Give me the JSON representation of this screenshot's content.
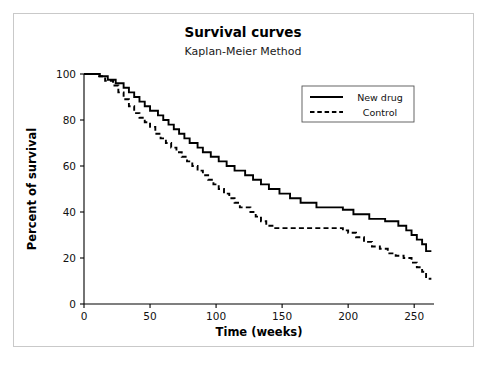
{
  "chart_data": {
    "type": "line",
    "title": "Survival curves",
    "subtitle": "Kaplan-Meier Method",
    "xlabel": "Time (weeks)",
    "ylabel": "Percent of survival",
    "xlim": [
      0,
      265
    ],
    "ylim": [
      0,
      100
    ],
    "xticks": [
      0,
      50,
      100,
      150,
      200,
      250
    ],
    "yticks": [
      0,
      20,
      40,
      60,
      80,
      100
    ],
    "grid": false,
    "legend_position": "top-right",
    "series": [
      {
        "name": "New drug",
        "style": "solid",
        "color": "#000000",
        "points": [
          [
            0,
            100
          ],
          [
            12,
            100
          ],
          [
            12,
            99
          ],
          [
            18,
            99
          ],
          [
            18,
            97.5
          ],
          [
            24,
            97.5
          ],
          [
            24,
            96
          ],
          [
            30,
            96
          ],
          [
            30,
            94
          ],
          [
            34,
            94
          ],
          [
            34,
            92
          ],
          [
            38,
            92
          ],
          [
            38,
            90
          ],
          [
            42,
            90
          ],
          [
            42,
            88
          ],
          [
            46,
            88
          ],
          [
            46,
            86
          ],
          [
            50,
            86
          ],
          [
            50,
            84
          ],
          [
            56,
            84
          ],
          [
            56,
            82
          ],
          [
            60,
            82
          ],
          [
            60,
            80
          ],
          [
            64,
            80
          ],
          [
            64,
            78
          ],
          [
            68,
            78
          ],
          [
            68,
            76
          ],
          [
            72,
            76
          ],
          [
            72,
            74
          ],
          [
            76,
            74
          ],
          [
            76,
            72
          ],
          [
            80,
            72
          ],
          [
            80,
            70
          ],
          [
            86,
            70
          ],
          [
            86,
            68
          ],
          [
            90,
            68
          ],
          [
            90,
            66
          ],
          [
            96,
            66
          ],
          [
            96,
            64
          ],
          [
            102,
            64
          ],
          [
            102,
            62
          ],
          [
            108,
            62
          ],
          [
            108,
            60
          ],
          [
            114,
            60
          ],
          [
            114,
            58
          ],
          [
            122,
            58
          ],
          [
            122,
            56
          ],
          [
            128,
            56
          ],
          [
            128,
            54
          ],
          [
            134,
            54
          ],
          [
            134,
            52
          ],
          [
            140,
            52
          ],
          [
            140,
            50
          ],
          [
            148,
            50
          ],
          [
            148,
            48
          ],
          [
            156,
            48
          ],
          [
            156,
            46
          ],
          [
            164,
            46
          ],
          [
            164,
            44
          ],
          [
            176,
            44
          ],
          [
            176,
            42
          ],
          [
            196,
            42
          ],
          [
            196,
            41
          ],
          [
            204,
            41
          ],
          [
            204,
            39
          ],
          [
            216,
            39
          ],
          [
            216,
            37
          ],
          [
            228,
            37
          ],
          [
            228,
            36
          ],
          [
            238,
            36
          ],
          [
            238,
            34
          ],
          [
            244,
            34
          ],
          [
            244,
            32
          ],
          [
            248,
            32
          ],
          [
            248,
            30
          ],
          [
            252,
            30
          ],
          [
            252,
            28
          ],
          [
            256,
            28
          ],
          [
            256,
            26
          ],
          [
            259,
            26
          ],
          [
            259,
            23
          ],
          [
            263,
            23
          ]
        ]
      },
      {
        "name": "Control",
        "style": "dashed",
        "color": "#000000",
        "points": [
          [
            0,
            100
          ],
          [
            10,
            100
          ],
          [
            10,
            99
          ],
          [
            16,
            99
          ],
          [
            16,
            97
          ],
          [
            22,
            97
          ],
          [
            22,
            95
          ],
          [
            26,
            95
          ],
          [
            26,
            92
          ],
          [
            30,
            92
          ],
          [
            30,
            89
          ],
          [
            34,
            89
          ],
          [
            34,
            86
          ],
          [
            38,
            86
          ],
          [
            38,
            83
          ],
          [
            42,
            83
          ],
          [
            42,
            81
          ],
          [
            46,
            81
          ],
          [
            46,
            79
          ],
          [
            50,
            79
          ],
          [
            50,
            77
          ],
          [
            54,
            77
          ],
          [
            54,
            74
          ],
          [
            58,
            74
          ],
          [
            58,
            72
          ],
          [
            62,
            72
          ],
          [
            62,
            70
          ],
          [
            66,
            70
          ],
          [
            66,
            68
          ],
          [
            70,
            68
          ],
          [
            70,
            66
          ],
          [
            74,
            66
          ],
          [
            74,
            64
          ],
          [
            78,
            64
          ],
          [
            78,
            62
          ],
          [
            82,
            62
          ],
          [
            82,
            60
          ],
          [
            86,
            60
          ],
          [
            86,
            58
          ],
          [
            90,
            58
          ],
          [
            90,
            56
          ],
          [
            94,
            56
          ],
          [
            94,
            54
          ],
          [
            98,
            54
          ],
          [
            98,
            52
          ],
          [
            102,
            52
          ],
          [
            102,
            50
          ],
          [
            106,
            50
          ],
          [
            106,
            48
          ],
          [
            110,
            48
          ],
          [
            110,
            46
          ],
          [
            114,
            46
          ],
          [
            114,
            44
          ],
          [
            118,
            44
          ],
          [
            118,
            42
          ],
          [
            126,
            42
          ],
          [
            126,
            40
          ],
          [
            130,
            40
          ],
          [
            130,
            38
          ],
          [
            134,
            38
          ],
          [
            134,
            36
          ],
          [
            138,
            36
          ],
          [
            138,
            34
          ],
          [
            144,
            34
          ],
          [
            144,
            33
          ],
          [
            196,
            33
          ],
          [
            196,
            32
          ],
          [
            200,
            32
          ],
          [
            200,
            31
          ],
          [
            206,
            31
          ],
          [
            206,
            29
          ],
          [
            212,
            29
          ],
          [
            212,
            27
          ],
          [
            218,
            27
          ],
          [
            218,
            25
          ],
          [
            224,
            25
          ],
          [
            224,
            24
          ],
          [
            230,
            24
          ],
          [
            230,
            22
          ],
          [
            236,
            22
          ],
          [
            236,
            21
          ],
          [
            242,
            21
          ],
          [
            242,
            20
          ],
          [
            248,
            20
          ],
          [
            248,
            18
          ],
          [
            252,
            18
          ],
          [
            252,
            16
          ],
          [
            256,
            16
          ],
          [
            256,
            14
          ],
          [
            259,
            14
          ],
          [
            259,
            11
          ],
          [
            263,
            11
          ]
        ]
      }
    ]
  },
  "legend": {
    "items": [
      {
        "label": "New drug",
        "style": "solid"
      },
      {
        "label": "Control",
        "style": "dashed"
      }
    ]
  }
}
